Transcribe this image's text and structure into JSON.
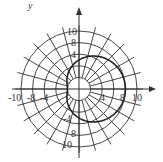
{
  "figure": {
    "type": "polar-graph",
    "axis_label_y": "y",
    "pole": {
      "x": 79,
      "y": 89
    },
    "unit_px": 5.8,
    "circle_radii": [
      2,
      4,
      6,
      8,
      10
    ],
    "radial_line_count": 24,
    "x_tick_labels": [
      "-10",
      "-8",
      "-4",
      "4",
      "8",
      "10"
    ],
    "y_tick_labels": [
      "10",
      "8",
      "4",
      "-4",
      "8",
      "10"
    ],
    "grid_color": "#333333",
    "curve_color": "#222222",
    "curve": {
      "equation": "r = 5 + 3cosθ",
      "a": 5,
      "b": 3
    }
  }
}
